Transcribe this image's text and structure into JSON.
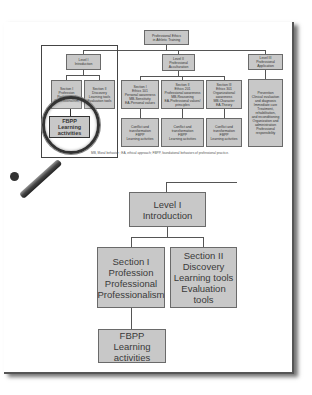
{
  "figure": {
    "top_diagram": {
      "root": "Professional Ethics\nin Athletic Training",
      "levels": [
        {
          "label": "Level I\nIntroduction",
          "sections": [
            "Section I\nProfession\nProfessional\nProfessionalism",
            "Section II\nDiscovery\nLearning tools\nEvaluation tools"
          ],
          "activity": "FBPP\nLearning\nactivities"
        },
        {
          "label": "Level II\nProfessional\nAcculturation",
          "sections": [
            "Section I\nEthics 101\nPersonal awareness\nMB-Sensitivity\nEA-Personal values",
            "Section II\nEthics 201\nProfessional awareness\nMB-Reasoning\nEA-Professional values/\nprinciples",
            "Section III\nEthics 301\nOrganizational\nawareness\nMB-Character\nEA-Theory"
          ],
          "activities": [
            "Conflict and\ntransformation\nFBPP\nLearning activities",
            "Conflict and\ntransformation\nFBPP\nLearning activities",
            "Conflict and\ntransformation\nFBPP\nLearning activities"
          ]
        },
        {
          "label": "Level III\nProfessional\nApplication",
          "content": "Prevention\nClinical evaluation\nand diagnosis\nImmediate care\nTreatment,\nrehabilitation,\nand reconditioning\nOrganization and\nadministration\nProfessional\nresponsibility"
        }
      ],
      "caption": "MB, Moral behavior ; EA, ethical approach; FBPP, foundational behaviors of professional practice.",
      "magnified": "FBPP\nLearning\nactivities"
    },
    "zoomed_diagram": {
      "level": "Level I\nIntroduction",
      "section1": "Section I\nProfession\nProfessional\nProfessionalism",
      "section2": "Section II\nDiscovery\nLearning tools\nEvaluation tools",
      "activity": "FBPP\nLearning\nactivities"
    },
    "colors": {
      "box_fill": "#c8c8c8",
      "box_border": "#6a6a6a",
      "line": "#555555"
    }
  }
}
